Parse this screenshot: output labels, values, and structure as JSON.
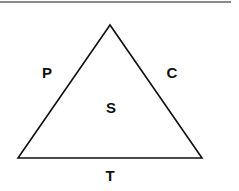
{
  "diagram": {
    "type": "triangle",
    "labels": {
      "left_side": "P",
      "right_side": "C",
      "center": "S",
      "base": "T"
    },
    "colors": {
      "stroke": "#111111",
      "text": "#111111",
      "rule": "#8a8a8a"
    }
  }
}
